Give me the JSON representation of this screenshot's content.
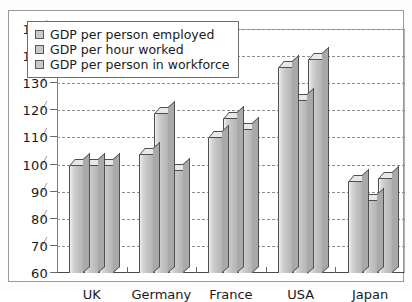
{
  "chart_data": {
    "type": "bar",
    "title": "",
    "xlabel": "",
    "ylabel": "",
    "ylim": [
      60,
      150
    ],
    "ytick_step": 10,
    "yticks": [
      60,
      70,
      80,
      90,
      100,
      110,
      120,
      130,
      140,
      150
    ],
    "grid": true,
    "legend_position": "top-left",
    "categories": [
      "UK",
      "Germany",
      "France",
      "USA",
      "Japan"
    ],
    "series": [
      {
        "name": "GDP per person employed",
        "values": [
          100,
          104,
          110,
          136,
          94
        ]
      },
      {
        "name": "GDP per hour worked",
        "values": [
          100,
          119,
          117,
          124,
          87
        ]
      },
      {
        "name": "GDP per person in workforce",
        "values": [
          100,
          98,
          113,
          139,
          95
        ]
      }
    ],
    "colors": {
      "bar_face": "#c4c4c4",
      "bar_top": "#e8e8e8",
      "bar_side": "#a9a9a9",
      "bar_outline": "#4f4f4f",
      "gridline": "#8e8e8e",
      "axis": "#4a4a4a",
      "background": "#ffffff"
    }
  },
  "legend": {
    "items": [
      {
        "label": "GDP per person employed"
      },
      {
        "label": "GDP per hour worked"
      },
      {
        "label": "GDP per person in workforce"
      }
    ]
  },
  "axis": {
    "y_labels": [
      "150",
      "140",
      "130",
      "120",
      "110",
      "100",
      "90",
      "80",
      "70",
      "60"
    ],
    "x_labels": [
      "UK",
      "Germany",
      "France",
      "USA",
      "Japan"
    ]
  }
}
